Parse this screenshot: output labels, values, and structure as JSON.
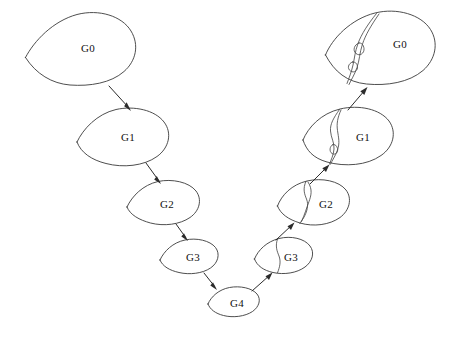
{
  "figure": {
    "background_color": "#ffffff",
    "stroke_color": "#3a3a3a",
    "label_color": "#111111",
    "width": 453,
    "height": 337
  },
  "left_branch": {
    "name": "coarsening-branch",
    "direction": "down-right",
    "nodes": [
      {
        "id": "left-g0",
        "label": "G0",
        "label_x": 88,
        "label_y": 48,
        "cx": 80,
        "cy": 48,
        "rx": 56,
        "ry": 37
      },
      {
        "id": "left-g1",
        "label": "G1",
        "label_x": 128,
        "label_y": 137,
        "cx": 121,
        "cy": 135,
        "rx": 45,
        "ry": 28
      },
      {
        "id": "left-g2",
        "label": "G2",
        "label_x": 167,
        "label_y": 204,
        "cx": 162,
        "cy": 202,
        "rx": 36,
        "ry": 23
      },
      {
        "id": "left-g3",
        "label": "G3",
        "label_x": 193,
        "label_y": 257,
        "cx": 188,
        "cy": 256,
        "rx": 29,
        "ry": 18
      }
    ]
  },
  "vertex": {
    "name": "coarsest-grid",
    "node": {
      "id": "bottom-g4",
      "label": "G4",
      "label_x": 237,
      "label_y": 303,
      "cx": 233,
      "cy": 302,
      "rx": 26,
      "ry": 15
    }
  },
  "right_branch": {
    "name": "refinement-branch",
    "direction": "up-right",
    "nodes": [
      {
        "id": "right-g3",
        "label": "G3",
        "label_x": 291,
        "label_y": 256,
        "cx": 283,
        "cy": 255,
        "rx": 29,
        "ry": 19,
        "has_interface": true
      },
      {
        "id": "right-g2",
        "label": "G2",
        "label_x": 326,
        "label_y": 203,
        "cx": 313,
        "cy": 202,
        "rx": 36,
        "ry": 24,
        "has_interface": true
      },
      {
        "id": "right-g1",
        "label": "G1",
        "label_x": 363,
        "label_y": 136,
        "cx": 349,
        "cy": 134,
        "rx": 45,
        "ry": 29,
        "has_interface": true
      },
      {
        "id": "right-g0",
        "label": "G0",
        "label_x": 400,
        "label_y": 43,
        "cx": 381,
        "cy": 46,
        "rx": 56,
        "ry": 37,
        "has_interface": true
      }
    ]
  },
  "arrows": [
    {
      "id": "arrow-left-g0-g1",
      "from": "left-g0",
      "to": "left-g1",
      "x1": 109,
      "y1": 86,
      "x2": 130,
      "y2": 110,
      "dir": "down-right"
    },
    {
      "id": "arrow-left-g1-g2",
      "from": "left-g1",
      "to": "left-g2",
      "x1": 146,
      "y1": 163,
      "x2": 160,
      "y2": 183,
      "dir": "down-right"
    },
    {
      "id": "arrow-left-g2-g3",
      "from": "left-g2",
      "to": "left-g3",
      "x1": 176,
      "y1": 224,
      "x2": 187,
      "y2": 240,
      "dir": "down-right"
    },
    {
      "id": "arrow-left-g3-g4",
      "from": "left-g3",
      "to": "bottom-g4",
      "x1": 204,
      "y1": 273,
      "x2": 216,
      "y2": 289,
      "dir": "down-right"
    },
    {
      "id": "arrow-right-g4-g3",
      "from": "bottom-g4",
      "to": "right-g3",
      "x1": 253,
      "y1": 290,
      "x2": 271,
      "y2": 273,
      "dir": "up-right"
    },
    {
      "id": "arrow-right-g3-g2",
      "from": "right-g3",
      "to": "right-g2",
      "x1": 277,
      "y1": 239,
      "x2": 293,
      "y2": 223,
      "dir": "up-right"
    },
    {
      "id": "arrow-right-g2-g1",
      "from": "right-g2",
      "to": "right-g1",
      "x1": 311,
      "y1": 183,
      "x2": 328,
      "y2": 165,
      "dir": "up-right"
    },
    {
      "id": "arrow-right-g1-g0",
      "from": "right-g1",
      "to": "right-g0",
      "x1": 348,
      "y1": 110,
      "x2": 366,
      "y2": 88,
      "dir": "up-right"
    }
  ]
}
